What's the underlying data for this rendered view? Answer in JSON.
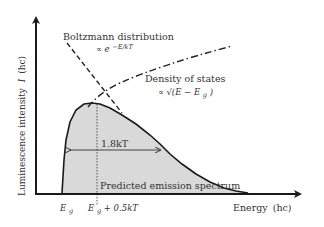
{
  "figure": {
    "type": "diagram",
    "y_axis": {
      "label": "Luminescence intensity",
      "symbol": "I",
      "unit": "(hc)"
    },
    "x_axis": {
      "label": "Energy",
      "unit": "(hc)"
    },
    "curves": {
      "boltzmann": {
        "label": "Boltzmann distribution",
        "formula_prefix": "∝ e",
        "formula_exp": "−E/kT",
        "style": "dashed"
      },
      "density_of_states": {
        "label": "Density of states",
        "formula": "∝ √(E − E",
        "formula_sub": "g",
        "formula_close": ")",
        "style": "dash-dot"
      },
      "emission": {
        "label": "Predicted emission spectrum",
        "fill": "#d9d9d9",
        "style": "solid"
      }
    },
    "fwhm": {
      "label": "1.8kT"
    },
    "x_ticks": [
      {
        "main": "E",
        "sub": "g",
        "suffix": ""
      },
      {
        "main": "E",
        "sub": "g",
        "suffix": " + 0.5kT"
      }
    ],
    "colors": {
      "line": "#1a1a1a",
      "fill": "#d9d9d9",
      "text": "#333333"
    }
  }
}
